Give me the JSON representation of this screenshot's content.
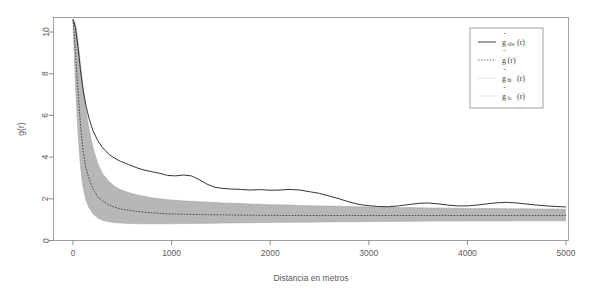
{
  "chart_data": {
    "type": "line",
    "title": "",
    "xlabel": "Distancia en metros",
    "ylabel": "g(r)",
    "xlim": [
      0,
      5200
    ],
    "ylim": [
      0,
      10.6
    ],
    "xticks": [
      0,
      1000,
      2000,
      3000,
      4000,
      5000
    ],
    "xticklabels": [
      "0",
      "1000",
      "2000",
      "3000",
      "4000",
      "5000"
    ],
    "yticks": [
      0,
      2,
      4,
      6,
      8,
      10
    ],
    "yticklabels": [
      "0",
      "2",
      "4",
      "6",
      "8",
      "10"
    ],
    "grid": false,
    "legend_position": "top-right",
    "colors": {
      "observed": "#2b2b2b",
      "theoretical": "#3a3a3a",
      "envelope_band": "#b3b3b3",
      "axis": "#6e6e6e",
      "box": "#8a8a8a",
      "background": "#ffffff"
    },
    "x": [
      0,
      25,
      50,
      75,
      100,
      130,
      160,
      200,
      250,
      300,
      360,
      420,
      480,
      560,
      640,
      720,
      800,
      880,
      960,
      1040,
      1120,
      1200,
      1280,
      1360,
      1440,
      1520,
      1600,
      1700,
      1800,
      1900,
      2000,
      2100,
      2200,
      2300,
      2400,
      2500,
      2600,
      2700,
      2800,
      2900,
      3000,
      3100,
      3200,
      3300,
      3400,
      3500,
      3600,
      3700,
      3800,
      3900,
      4000,
      4100,
      4200,
      4300,
      4400,
      4500,
      4600,
      4700,
      4800,
      4900,
      5000
    ],
    "series": [
      {
        "name": "g_obs(r)",
        "label": "observed",
        "style": "solid",
        "values": [
          10.6,
          10.2,
          9.3,
          8.2,
          7.3,
          6.5,
          5.9,
          5.3,
          4.8,
          4.45,
          4.15,
          3.95,
          3.8,
          3.65,
          3.5,
          3.38,
          3.3,
          3.22,
          3.12,
          3.1,
          3.14,
          3.1,
          2.92,
          2.7,
          2.55,
          2.5,
          2.47,
          2.45,
          2.42,
          2.44,
          2.41,
          2.42,
          2.45,
          2.42,
          2.34,
          2.26,
          2.13,
          2.0,
          1.85,
          1.73,
          1.67,
          1.63,
          1.62,
          1.66,
          1.72,
          1.78,
          1.8,
          1.76,
          1.7,
          1.66,
          1.66,
          1.7,
          1.76,
          1.81,
          1.83,
          1.8,
          1.75,
          1.7,
          1.66,
          1.63,
          1.61
        ]
      },
      {
        "name": "g_bar(r)",
        "label": "mean / theoretical",
        "style": "dashed",
        "values": [
          10.6,
          9.0,
          7.2,
          5.6,
          4.4,
          3.5,
          3.0,
          2.5,
          2.1,
          1.9,
          1.72,
          1.6,
          1.52,
          1.45,
          1.4,
          1.36,
          1.33,
          1.3,
          1.28,
          1.27,
          1.26,
          1.25,
          1.24,
          1.24,
          1.23,
          1.23,
          1.22,
          1.22,
          1.21,
          1.21,
          1.21,
          1.2,
          1.2,
          1.2,
          1.2,
          1.2,
          1.2,
          1.2,
          1.2,
          1.2,
          1.2,
          1.2,
          1.2,
          1.2,
          1.2,
          1.2,
          1.2,
          1.2,
          1.2,
          1.2,
          1.2,
          1.2,
          1.2,
          1.2,
          1.2,
          1.2,
          1.2,
          1.2,
          1.2,
          1.2,
          1.2
        ]
      },
      {
        "name": "g_hi(r)",
        "label": "upper envelope",
        "style": "envelope",
        "values": [
          10.6,
          10.4,
          9.6,
          8.5,
          7.4,
          6.3,
          5.4,
          4.5,
          3.7,
          3.2,
          2.85,
          2.6,
          2.45,
          2.3,
          2.2,
          2.12,
          2.05,
          2.0,
          1.96,
          1.93,
          1.9,
          1.88,
          1.86,
          1.84,
          1.82,
          1.8,
          1.79,
          1.77,
          1.75,
          1.74,
          1.72,
          1.71,
          1.7,
          1.68,
          1.67,
          1.66,
          1.65,
          1.64,
          1.63,
          1.62,
          1.61,
          1.6,
          1.59,
          1.58,
          1.58,
          1.57,
          1.56,
          1.56,
          1.55,
          1.55,
          1.54,
          1.54,
          1.53,
          1.53,
          1.52,
          1.52,
          1.52,
          1.51,
          1.51,
          1.51,
          1.5
        ]
      },
      {
        "name": "g_lo(r)",
        "label": "lower envelope",
        "style": "envelope",
        "values": [
          10.6,
          7.5,
          5.2,
          3.6,
          2.6,
          1.95,
          1.6,
          1.3,
          1.08,
          0.97,
          0.9,
          0.86,
          0.84,
          0.82,
          0.81,
          0.8,
          0.8,
          0.8,
          0.8,
          0.81,
          0.81,
          0.82,
          0.82,
          0.83,
          0.83,
          0.84,
          0.84,
          0.85,
          0.85,
          0.86,
          0.86,
          0.87,
          0.87,
          0.88,
          0.88,
          0.89,
          0.89,
          0.9,
          0.9,
          0.9,
          0.91,
          0.91,
          0.91,
          0.92,
          0.92,
          0.92,
          0.93,
          0.93,
          0.93,
          0.93,
          0.94,
          0.94,
          0.94,
          0.94,
          0.94,
          0.95,
          0.95,
          0.95,
          0.95,
          0.95,
          0.95
        ]
      }
    ],
    "legend": {
      "entries": [
        {
          "hat": "ˆ",
          "base": "g",
          "sub": "obs",
          "arg": "(r)",
          "style": "solid"
        },
        {
          "hat": "¯",
          "base": "g",
          "sub": "",
          "arg": "(r)",
          "style": "dashed"
        },
        {
          "hat": "ˆ",
          "base": "g",
          "sub": "hi",
          "arg": "(r)",
          "style": "dotted"
        },
        {
          "hat": "ˆ",
          "base": "g",
          "sub": "lo",
          "arg": "(r)",
          "style": "dotted"
        }
      ]
    }
  }
}
